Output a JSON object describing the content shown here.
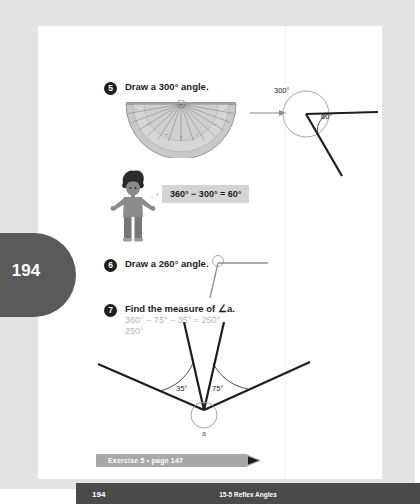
{
  "page": {
    "side_tab_number": "194",
    "footer_page_number": "194",
    "footer_chapter_title": "15-5 Reflex Angles"
  },
  "questions": [
    {
      "number": "5",
      "text": "Draw a 300° angle."
    },
    {
      "number": "6",
      "text": "Draw a 260° angle."
    },
    {
      "number": "7",
      "text": "Find the measure of ∠a."
    }
  ],
  "student_work": {
    "line1": "360° − 75° − 35° = 250°",
    "line2": "250°"
  },
  "equation_bubble": {
    "text": "360° − 300° = 60°"
  },
  "diagram_300": {
    "reflex_label": "300°",
    "acute_label": "60°"
  },
  "diagram_a": {
    "left_angle_label": "35°",
    "right_angle_label": "75°",
    "vertex_label": "a"
  },
  "exercise_banner": {
    "text": "Exercise 5 • page 147"
  },
  "colors": {
    "page_background": "#e3e3e3",
    "sheet": "#ffffff",
    "tab_gray": "#5a5a5a",
    "footer_gray": "#4a4a4a",
    "banner_gray": "#a8a8a8",
    "highlight_gray": "#d4d4d4",
    "handwriting_gray": "#b6b6b6",
    "ink_black": "#1d1d1d"
  }
}
